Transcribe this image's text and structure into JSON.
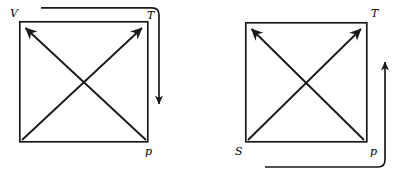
{
  "figure": {
    "type": "thermodynamic-square-pair",
    "background_color": "#ffffff",
    "stroke_color": "#1a1a1a",
    "line_width_box": 1.6,
    "line_width_diagonal": 1.8,
    "line_width_path": 1.8
  },
  "left_square": {
    "name": "left-thermodynamic-square",
    "box": {
      "x": 19,
      "y": 21,
      "width": 129,
      "height": 121
    },
    "corner_labels": {
      "top_left": "V",
      "top_right": "T",
      "bottom_right": "p"
    },
    "diagonals": [
      {
        "name": "diagonal-up-left",
        "from": [
          146,
          140
        ],
        "to": [
          24,
          27
        ],
        "arrowhead": "to-end"
      },
      {
        "name": "diagonal-up-right",
        "from": [
          24,
          140
        ],
        "to": [
          143,
          27
        ],
        "arrowhead": "to-end"
      }
    ],
    "cycle_path": {
      "name": "left-wrap-arrow",
      "description": "horizontal segment above the square turning down the right side ending in a downward arrowhead",
      "points": [
        [
          41,
          8
        ],
        [
          152,
          8
        ],
        [
          159,
          15
        ],
        [
          159,
          112
        ]
      ],
      "corner_radius": 7,
      "arrow_direction": "down",
      "arrow_tip": [
        159,
        112
      ]
    }
  },
  "right_square": {
    "name": "right-thermodynamic-square",
    "box": {
      "x": 245,
      "y": 22,
      "width": 122,
      "height": 120
    },
    "corner_labels": {
      "top_right": "T",
      "bottom_left": "S",
      "bottom_right": "p"
    },
    "diagonals": [
      {
        "name": "diagonal-up-left",
        "from": [
          364,
          140
        ],
        "to": [
          250,
          28
        ],
        "arrowhead": "to-end"
      },
      {
        "name": "diagonal-up-right",
        "from": [
          250,
          140
        ],
        "to": [
          362,
          28
        ],
        "arrowhead": "to-end"
      }
    ],
    "cycle_path": {
      "name": "right-wrap-arrow",
      "description": "horizontal segment below the square turning up the right side ending in an upward arrowhead",
      "points": [
        [
          265,
          167
        ],
        [
          378,
          167
        ],
        [
          385,
          160
        ],
        [
          385,
          54
        ]
      ],
      "corner_radius": 7,
      "arrow_direction": "up",
      "arrow_tip": [
        385,
        54
      ]
    }
  }
}
